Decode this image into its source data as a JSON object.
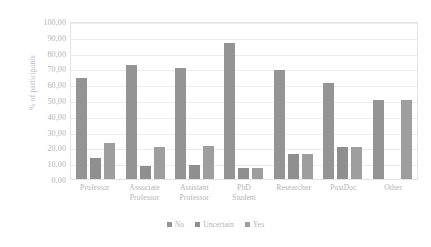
{
  "chart_data": {
    "type": "bar",
    "title": "",
    "xlabel": "",
    "ylabel": "% of participants",
    "ylim": [
      0,
      100
    ],
    "ytick_step": 10,
    "ytick_labels": [
      "100,00",
      "90,00",
      "80,00",
      "70,00",
      "60,00",
      "50,00",
      "40,00",
      "30,00",
      "20,00",
      "10,00",
      "0,00"
    ],
    "ytick_values": [
      100,
      90,
      80,
      70,
      60,
      50,
      40,
      30,
      20,
      10,
      0
    ],
    "grid": "horizontal",
    "legend_position": "bottom",
    "categories": [
      "Professor",
      "Associate Professor",
      "Assistant Professor",
      "PhD Student",
      "Researcher",
      "PostDoc",
      "Other"
    ],
    "category_lines": [
      [
        "Professor"
      ],
      [
        "Associate",
        "Professor"
      ],
      [
        "Assistant",
        "Professor"
      ],
      [
        "PhD",
        "Student"
      ],
      [
        "Researcher"
      ],
      [
        "PostDoc"
      ],
      [
        "Other"
      ]
    ],
    "series": [
      {
        "name": "No",
        "color": "#949494",
        "values": [
          64,
          72,
          70,
          86,
          69,
          61,
          50
        ]
      },
      {
        "name": "Uncertain",
        "color": "#8f8f8f",
        "values": [
          13,
          8,
          9,
          7,
          16,
          20,
          0
        ]
      },
      {
        "name": "Yes",
        "color": "#9e9e9e",
        "values": [
          23,
          20,
          21,
          7,
          16,
          20,
          50
        ]
      }
    ]
  },
  "legend": {
    "items": [
      {
        "label": "No",
        "color": "#949494"
      },
      {
        "label": "Uncertain",
        "color": "#8f8f8f"
      },
      {
        "label": "Yes",
        "color": "#9e9e9e"
      }
    ]
  }
}
